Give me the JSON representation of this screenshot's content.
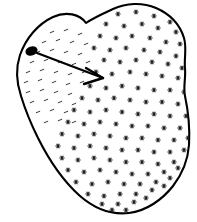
{
  "figure": {
    "type": "line-drawing",
    "background_color": "#ffffff",
    "outline_color": "#000000",
    "outline_width": 2.1,
    "mark_color": "#1a1a1a",
    "dash_color": "#3a3a3a",
    "canvas": {
      "width": 197,
      "height": 222
    },
    "labels": {
      "blob": "blob-outline",
      "dot": "lesion-dot",
      "arrow": "pointer-arrow",
      "stipple": "star-stipple-field",
      "dashes": "dash-stipple-field"
    }
  },
  "blob": {
    "name": "irregular-closed-contour",
    "path": "M 86 23 C 80 14 66 11 53 17 C 38 24 26 38 20 55 C 15 70 17 84 21 96 C 25 109 30 122 38 138 C 48 158 62 180 80 196 C 95 209 112 215 129 213 C 146 211 162 200 173 186 C 183 173 188 159 189 145 C 190 128 188 110 185 96 C 183 86 186 78 185 68 C 184 58 187 48 184 38 C 180 25 170 14 156 8 C 142 2 126 3 113 9 C 102 14 93 18 86 23 Z"
  },
  "lesion_dot": {
    "name": "filled-dark-spot",
    "cx": 31.5,
    "cy": 51.0,
    "rx": 6.2,
    "ry": 4.6,
    "rotation": -18
  },
  "arrow": {
    "name": "pointer-arrow",
    "tail_x": 37,
    "tail_y": 53,
    "tip_x": 103,
    "tip_y": 78,
    "head_upper_x": 86,
    "head_upper_y": 68,
    "head_lower_x": 84,
    "head_lower_y": 84
  },
  "stipple": {
    "name": "star-stipple-field",
    "glyph": "six-point-star",
    "radius": 2.6,
    "count_label": "dense",
    "points": [
      [
        118,
        14
      ],
      [
        136,
        12
      ],
      [
        154,
        16
      ],
      [
        170,
        22
      ],
      [
        106,
        24
      ],
      [
        124,
        26
      ],
      [
        142,
        24
      ],
      [
        158,
        28
      ],
      [
        176,
        32
      ],
      [
        100,
        36
      ],
      [
        116,
        38
      ],
      [
        132,
        36
      ],
      [
        150,
        38
      ],
      [
        166,
        42
      ],
      [
        180,
        44
      ],
      [
        94,
        48
      ],
      [
        110,
        50
      ],
      [
        126,
        48
      ],
      [
        144,
        50
      ],
      [
        160,
        52
      ],
      [
        176,
        56
      ],
      [
        104,
        60
      ],
      [
        120,
        62
      ],
      [
        136,
        60
      ],
      [
        152,
        62
      ],
      [
        168,
        64
      ],
      [
        182,
        68
      ],
      [
        96,
        72
      ],
      [
        112,
        74
      ],
      [
        130,
        72
      ],
      [
        146,
        74
      ],
      [
        162,
        76
      ],
      [
        178,
        78
      ],
      [
        90,
        86
      ],
      [
        106,
        88
      ],
      [
        122,
        86
      ],
      [
        138,
        88
      ],
      [
        154,
        90
      ],
      [
        170,
        90
      ],
      [
        184,
        92
      ],
      [
        82,
        98
      ],
      [
        98,
        100
      ],
      [
        114,
        98
      ],
      [
        130,
        100
      ],
      [
        146,
        102
      ],
      [
        162,
        102
      ],
      [
        178,
        104
      ],
      [
        74,
        110
      ],
      [
        90,
        112
      ],
      [
        106,
        110
      ],
      [
        122,
        112
      ],
      [
        138,
        114
      ],
      [
        154,
        114
      ],
      [
        170,
        116
      ],
      [
        186,
        116
      ],
      [
        68,
        122
      ],
      [
        84,
        124
      ],
      [
        100,
        122
      ],
      [
        116,
        124
      ],
      [
        132,
        126
      ],
      [
        148,
        126
      ],
      [
        164,
        128
      ],
      [
        180,
        128
      ],
      [
        62,
        134
      ],
      [
        78,
        136
      ],
      [
        94,
        134
      ],
      [
        110,
        136
      ],
      [
        126,
        138
      ],
      [
        142,
        138
      ],
      [
        158,
        140
      ],
      [
        174,
        140
      ],
      [
        188,
        138
      ],
      [
        58,
        146
      ],
      [
        74,
        148
      ],
      [
        90,
        146
      ],
      [
        106,
        148
      ],
      [
        122,
        150
      ],
      [
        138,
        150
      ],
      [
        154,
        152
      ],
      [
        170,
        152
      ],
      [
        184,
        150
      ],
      [
        62,
        158
      ],
      [
        78,
        160
      ],
      [
        94,
        158
      ],
      [
        110,
        160
      ],
      [
        126,
        162
      ],
      [
        142,
        162
      ],
      [
        158,
        164
      ],
      [
        174,
        162
      ],
      [
        68,
        170
      ],
      [
        84,
        172
      ],
      [
        100,
        170
      ],
      [
        116,
        172
      ],
      [
        132,
        174
      ],
      [
        148,
        174
      ],
      [
        164,
        172
      ],
      [
        178,
        168
      ],
      [
        76,
        182
      ],
      [
        92,
        184
      ],
      [
        108,
        182
      ],
      [
        124,
        184
      ],
      [
        140,
        184
      ],
      [
        156,
        182
      ],
      [
        170,
        178
      ],
      [
        88,
        194
      ],
      [
        104,
        196
      ],
      [
        120,
        194
      ],
      [
        136,
        194
      ],
      [
        152,
        190
      ],
      [
        164,
        186
      ],
      [
        102,
        204
      ],
      [
        118,
        204
      ],
      [
        134,
        202
      ],
      [
        146,
        198
      ],
      [
        112,
        210
      ],
      [
        126,
        210
      ]
    ]
  },
  "dashes": {
    "name": "dash-stipple-field",
    "glyph": "short-tilted-dash",
    "length": 4.6,
    "angle_deg": -22,
    "points": [
      [
        52,
        32
      ],
      [
        66,
        30
      ],
      [
        80,
        34
      ],
      [
        44,
        42
      ],
      [
        58,
        40
      ],
      [
        72,
        42
      ],
      [
        86,
        44
      ],
      [
        38,
        52
      ],
      [
        52,
        50
      ],
      [
        66,
        52
      ],
      [
        80,
        54
      ],
      [
        32,
        62
      ],
      [
        46,
        60
      ],
      [
        60,
        62
      ],
      [
        74,
        64
      ],
      [
        88,
        62
      ],
      [
        28,
        72
      ],
      [
        42,
        70
      ],
      [
        56,
        72
      ],
      [
        70,
        74
      ],
      [
        84,
        72
      ],
      [
        26,
        82
      ],
      [
        40,
        80
      ],
      [
        54,
        82
      ],
      [
        68,
        84
      ],
      [
        82,
        82
      ],
      [
        28,
        92
      ],
      [
        42,
        90
      ],
      [
        56,
        92
      ],
      [
        70,
        94
      ],
      [
        32,
        102
      ],
      [
        46,
        100
      ],
      [
        60,
        102
      ],
      [
        74,
        104
      ],
      [
        38,
        112
      ],
      [
        52,
        110
      ],
      [
        66,
        112
      ],
      [
        46,
        122
      ],
      [
        60,
        120
      ],
      [
        74,
        122
      ]
    ]
  }
}
